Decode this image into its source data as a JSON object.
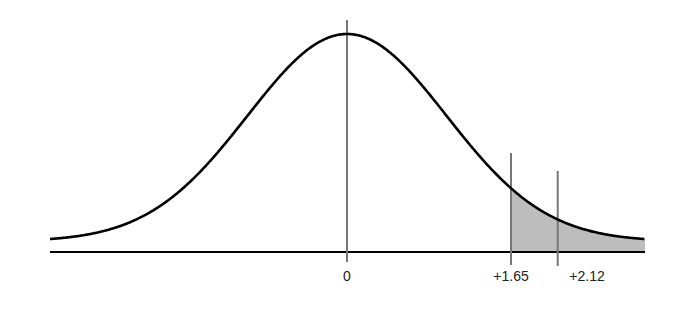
{
  "chart_data": {
    "type": "area",
    "title": "",
    "xlabel": "",
    "ylabel": "",
    "tick_labels": [
      "0",
      "+1.65",
      "+2.12"
    ],
    "ticks": [
      0,
      1.65,
      2.12
    ],
    "shaded_region": {
      "from": 1.65,
      "to": "infinity"
    },
    "xlim": [
      -3.0,
      3.0
    ],
    "grid": false,
    "legend": null,
    "colors": {
      "curve": "#000000",
      "shade": "#bdbdbd",
      "ref_lines": "#777777",
      "axis": "#000000"
    }
  }
}
